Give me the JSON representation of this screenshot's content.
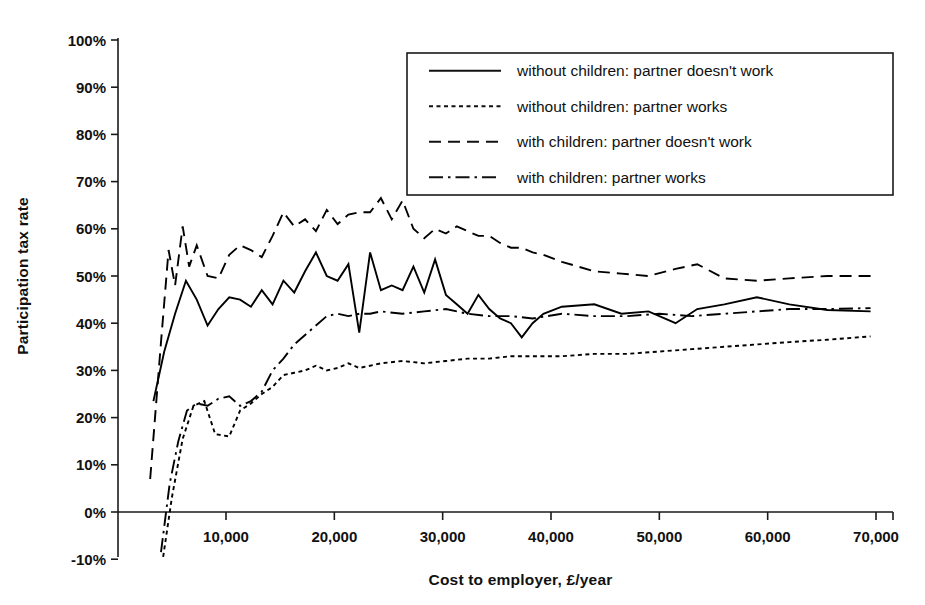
{
  "chart_data": {
    "type": "line",
    "title": "",
    "xlabel": "Cost to employer, £/year",
    "ylabel": "Participation tax rate",
    "xlim": [
      2000,
      71000
    ],
    "ylim": [
      -0.1,
      1.0
    ],
    "xticks": [
      10000,
      20000,
      30000,
      40000,
      50000,
      60000,
      70000
    ],
    "xticklabels": [
      "10,000",
      "20,000",
      "30,000",
      "40,000",
      "50,000",
      "60,000",
      "70,000"
    ],
    "yticks": [
      -0.1,
      0.0,
      0.1,
      0.2,
      0.3,
      0.4,
      0.5,
      0.6,
      0.7,
      0.8,
      0.9,
      1.0
    ],
    "yticklabels": [
      "-10%",
      "0%",
      "10%",
      "20%",
      "30%",
      "40%",
      "50%",
      "60%",
      "70%",
      "80%",
      "90%",
      "100%"
    ],
    "grid": false,
    "legend_position": "top-right",
    "series": [
      {
        "name": "without children: partner doesn't work",
        "style": "solid",
        "color": "#000000",
        "x": [
          3300,
          4300,
          5300,
          6300,
          7300,
          8300,
          9300,
          10300,
          11300,
          12300,
          13300,
          14300,
          15300,
          16300,
          17300,
          18300,
          19300,
          20300,
          21300,
          22300,
          23300,
          24300,
          25300,
          26300,
          27300,
          28300,
          29300,
          30300,
          31300,
          32300,
          33300,
          34300,
          35300,
          36300,
          37300,
          38300,
          39300,
          41000,
          44000,
          46500,
          49000,
          51500,
          53500,
          56000,
          59000,
          62000,
          65500,
          69500
        ],
        "y": [
          0.235,
          0.34,
          0.42,
          0.49,
          0.45,
          0.395,
          0.43,
          0.455,
          0.45,
          0.435,
          0.47,
          0.44,
          0.49,
          0.465,
          0.51,
          0.55,
          0.5,
          0.49,
          0.525,
          0.38,
          0.55,
          0.47,
          0.48,
          0.47,
          0.52,
          0.465,
          0.535,
          0.46,
          0.44,
          0.42,
          0.46,
          0.43,
          0.41,
          0.4,
          0.37,
          0.4,
          0.42,
          0.435,
          0.44,
          0.42,
          0.425,
          0.4,
          0.43,
          0.44,
          0.455,
          0.44,
          0.428,
          0.425
        ]
      },
      {
        "name": "without children: partner works",
        "style": "dotted",
        "color": "#000000",
        "x": [
          4200,
          5000,
          6000,
          7000,
          8000,
          9000,
          10300,
          11300,
          12300,
          13300,
          14300,
          15300,
          16300,
          17300,
          18300,
          19300,
          20300,
          21300,
          22300,
          24300,
          26300,
          28300,
          30300,
          32300,
          34300,
          36300,
          38300,
          41000,
          44000,
          47000,
          50000,
          53000,
          56000,
          59000,
          62000,
          65500,
          69500
        ],
        "y": [
          -0.095,
          0.03,
          0.155,
          0.225,
          0.235,
          0.165,
          0.16,
          0.215,
          0.23,
          0.25,
          0.265,
          0.29,
          0.295,
          0.3,
          0.31,
          0.3,
          0.305,
          0.315,
          0.305,
          0.315,
          0.32,
          0.315,
          0.32,
          0.325,
          0.325,
          0.33,
          0.33,
          0.33,
          0.335,
          0.335,
          0.34,
          0.345,
          0.35,
          0.355,
          0.36,
          0.365,
          0.372
        ]
      },
      {
        "name": "with children: partner doesn't work",
        "style": "dashed",
        "color": "#000000",
        "x": [
          3000,
          4000,
          4700,
          5300,
          6000,
          6600,
          7300,
          8300,
          9300,
          10300,
          11300,
          12300,
          13300,
          14300,
          15300,
          16300,
          17300,
          18300,
          19300,
          20300,
          21300,
          22300,
          23300,
          24300,
          25300,
          26300,
          27300,
          28300,
          29300,
          30300,
          31300,
          32300,
          33300,
          34300,
          35300,
          36300,
          37300,
          38300,
          39300,
          41000,
          44000,
          46500,
          49000,
          51500,
          53500,
          56000,
          59000,
          62000,
          65500,
          69500
        ],
        "y": [
          0.07,
          0.36,
          0.555,
          0.48,
          0.605,
          0.52,
          0.565,
          0.5,
          0.495,
          0.545,
          0.565,
          0.555,
          0.54,
          0.585,
          0.635,
          0.605,
          0.62,
          0.595,
          0.64,
          0.61,
          0.63,
          0.635,
          0.635,
          0.665,
          0.62,
          0.66,
          0.6,
          0.58,
          0.6,
          0.59,
          0.605,
          0.595,
          0.585,
          0.585,
          0.57,
          0.56,
          0.56,
          0.55,
          0.545,
          0.53,
          0.51,
          0.505,
          0.5,
          0.515,
          0.525,
          0.495,
          0.49,
          0.495,
          0.5,
          0.5
        ]
      },
      {
        "name": "with children: partner works",
        "style": "dashdot",
        "color": "#000000",
        "x": [
          4000,
          4800,
          5600,
          6400,
          7300,
          8300,
          9300,
          10300,
          11300,
          12300,
          13300,
          14300,
          15300,
          16300,
          17300,
          18300,
          19300,
          20300,
          21300,
          22300,
          23300,
          24300,
          26300,
          28300,
          30300,
          32300,
          34300,
          36300,
          38300,
          41000,
          44000,
          47000,
          50000,
          53000,
          56000,
          59000,
          62000,
          65500,
          69500
        ],
        "y": [
          -0.085,
          0.06,
          0.15,
          0.215,
          0.23,
          0.225,
          0.24,
          0.245,
          0.225,
          0.235,
          0.255,
          0.3,
          0.325,
          0.355,
          0.375,
          0.395,
          0.415,
          0.42,
          0.415,
          0.42,
          0.42,
          0.425,
          0.42,
          0.425,
          0.43,
          0.42,
          0.415,
          0.415,
          0.41,
          0.42,
          0.415,
          0.415,
          0.42,
          0.415,
          0.42,
          0.425,
          0.43,
          0.43,
          0.432
        ]
      }
    ]
  },
  "legend": {
    "items": [
      {
        "label": "without children: partner doesn't work",
        "style": "solid"
      },
      {
        "label": "without children: partner works",
        "style": "dotted"
      },
      {
        "label": "with children: partner doesn't work",
        "style": "dashed"
      },
      {
        "label": "with children: partner works",
        "style": "dashdot"
      }
    ]
  }
}
